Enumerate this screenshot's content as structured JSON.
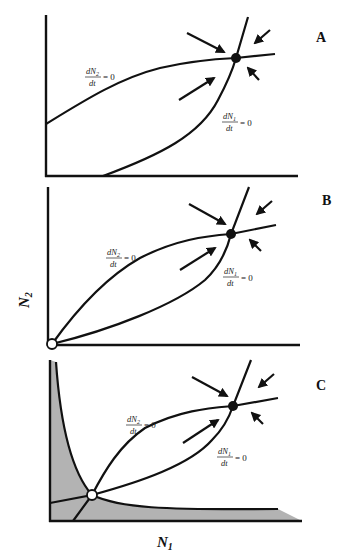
{
  "figure": {
    "panels": [
      {
        "id": "A",
        "label": "A",
        "n2_nullcline": {
          "num": "dN",
          "sub": "2",
          "den": "dt",
          "eq": "= 0"
        },
        "n1_nullcline": {
          "num": "dN",
          "sub": "1",
          "den": "dt",
          "eq": "= 0"
        },
        "equilibria": [
          {
            "type": "stable",
            "fill": "#111111"
          }
        ]
      },
      {
        "id": "B",
        "label": "B",
        "n2_nullcline": {
          "num": "dN",
          "sub": "2",
          "den": "dt",
          "eq": "= 0"
        },
        "n1_nullcline": {
          "num": "dN",
          "sub": "1",
          "den": "dt",
          "eq": "= 0"
        },
        "equilibria": [
          {
            "type": "stable",
            "fill": "#111111"
          },
          {
            "type": "unstable-origin",
            "fill": "#ffffff"
          }
        ]
      },
      {
        "id": "C",
        "label": "C",
        "n2_nullcline": {
          "num": "dN",
          "sub": "2",
          "den": "dt",
          "eq": "= 0"
        },
        "n1_nullcline": {
          "num": "dN",
          "sub": "1",
          "den": "dt",
          "eq": "= 0"
        },
        "equilibria": [
          {
            "type": "stable",
            "fill": "#111111"
          },
          {
            "type": "unstable-saddle",
            "fill": "#ffffff"
          }
        ],
        "shaded_region": {
          "meaning": "extinction basin",
          "color": "#b3b3b3"
        }
      }
    ],
    "y_axis_label": {
      "main": "N",
      "sub": "2"
    },
    "x_axis_label": {
      "main": "N",
      "sub": "1"
    },
    "colors": {
      "ink": "#111111",
      "shade": "#b3b3b3",
      "background": "#ffffff"
    }
  }
}
